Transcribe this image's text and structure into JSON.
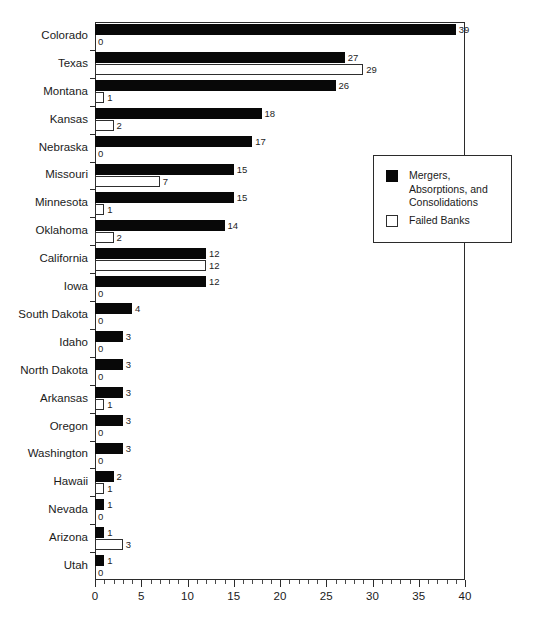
{
  "chart_data": {
    "type": "bar",
    "orientation": "horizontal",
    "title": "",
    "xlabel": "",
    "ylabel": "",
    "xlim": [
      0,
      40
    ],
    "xticks": [
      0,
      5,
      10,
      15,
      20,
      25,
      30,
      35,
      40
    ],
    "xtick_labels": [
      "0",
      "5",
      "10",
      "15",
      "20",
      "25",
      "30",
      "35",
      "40"
    ],
    "minor_tick_step": 1,
    "grid": false,
    "legend_position": "right-middle",
    "categories": [
      "Colorado",
      "Texas",
      "Montana",
      "Kansas",
      "Nebraska",
      "Missouri",
      "Minnesota",
      "Oklahoma",
      "California",
      "Iowa",
      "South Dakota",
      "Idaho",
      "North Dakota",
      "Arkansas",
      "Oregon",
      "Washington",
      "Hawaii",
      "Nevada",
      "Arizona",
      "Utah"
    ],
    "series": [
      {
        "name": "Mergers, Absorptions, and Consolidations",
        "color": "#080808",
        "style": "filled",
        "values": [
          39,
          27,
          26,
          18,
          17,
          15,
          15,
          14,
          12,
          12,
          4,
          3,
          3,
          3,
          3,
          3,
          2,
          1,
          1,
          1
        ]
      },
      {
        "name": "Failed Banks",
        "color": "#ffffff",
        "style": "hollow",
        "values": [
          0,
          29,
          1,
          2,
          0,
          7,
          1,
          2,
          12,
          0,
          0,
          0,
          0,
          1,
          0,
          0,
          1,
          0,
          3,
          0
        ]
      }
    ]
  },
  "legend": {
    "entries": [
      {
        "label": "Mergers,\nAbsorptions, and\nConsolidations",
        "swatch": "filled"
      },
      {
        "label": "Failed Banks",
        "swatch": "hollow"
      }
    ]
  }
}
